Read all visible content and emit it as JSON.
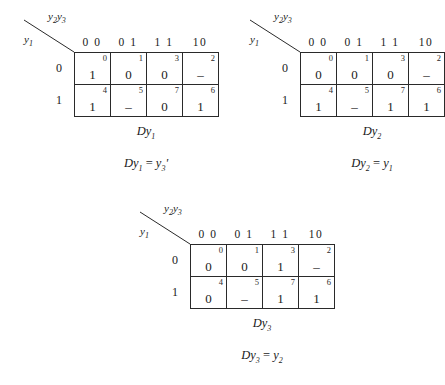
{
  "figure": {
    "column_variable_label": "y2y3",
    "row_variable_label": "y1",
    "column_headers": [
      "0 0",
      "0 1",
      "1 1",
      "10"
    ],
    "row_headers": [
      "0",
      "1"
    ]
  },
  "maps": [
    {
      "name": "Dy1",
      "title": "Dy",
      "title_sub": "1",
      "equation_lhs": "Dy",
      "equation_lhs_sub": "1",
      "equation_rhs": "y",
      "equation_rhs_sub": "3",
      "equation_rhs_suffix": "'",
      "rows": [
        {
          "row_label": "0",
          "cells": [
            {
              "index": "0",
              "value": "1"
            },
            {
              "index": "1",
              "value": "0"
            },
            {
              "index": "3",
              "value": "0"
            },
            {
              "index": "2",
              "value": "–"
            }
          ]
        },
        {
          "row_label": "1",
          "cells": [
            {
              "index": "4",
              "value": "1"
            },
            {
              "index": "5",
              "value": "–"
            },
            {
              "index": "7",
              "value": "0"
            },
            {
              "index": "6",
              "value": "1"
            }
          ]
        }
      ]
    },
    {
      "name": "Dy2",
      "title": "Dy",
      "title_sub": "2",
      "equation_lhs": "Dy",
      "equation_lhs_sub": "2",
      "equation_rhs": "y",
      "equation_rhs_sub": "1",
      "equation_rhs_suffix": "",
      "rows": [
        {
          "row_label": "0",
          "cells": [
            {
              "index": "0",
              "value": "0"
            },
            {
              "index": "1",
              "value": "0"
            },
            {
              "index": "3",
              "value": "0"
            },
            {
              "index": "2",
              "value": "–"
            }
          ]
        },
        {
          "row_label": "1",
          "cells": [
            {
              "index": "4",
              "value": "1"
            },
            {
              "index": "5",
              "value": "–"
            },
            {
              "index": "7",
              "value": "1"
            },
            {
              "index": "6",
              "value": "1"
            }
          ]
        }
      ]
    },
    {
      "name": "Dy3",
      "title": "Dy",
      "title_sub": "3",
      "equation_lhs": "Dy",
      "equation_lhs_sub": "3",
      "equation_rhs": "y",
      "equation_rhs_sub": "2",
      "equation_rhs_suffix": "",
      "rows": [
        {
          "row_label": "0",
          "cells": [
            {
              "index": "0",
              "value": "0"
            },
            {
              "index": "1",
              "value": "0"
            },
            {
              "index": "3",
              "value": "1"
            },
            {
              "index": "2",
              "value": "–"
            }
          ]
        },
        {
          "row_label": "1",
          "cells": [
            {
              "index": "4",
              "value": "0"
            },
            {
              "index": "5",
              "value": "–"
            },
            {
              "index": "7",
              "value": "1"
            },
            {
              "index": "6",
              "value": "1"
            }
          ]
        }
      ]
    }
  ],
  "equals_sign": "="
}
